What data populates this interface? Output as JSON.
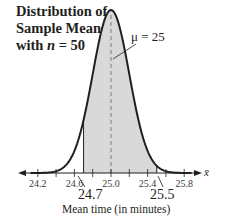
{
  "title": {
    "line1": "Distribution of",
    "line2": "Sample Means",
    "line3_prefix": "with ",
    "line3_var": "n",
    "line3_suffix": " = 50"
  },
  "annotations": {
    "mu_label": "μ = 25",
    "x_variable": "x̄",
    "lower_bound_label": "24.7",
    "upper_bound_label": "25.5"
  },
  "axis": {
    "xlabel": "Mean time (in minutes)",
    "tick_labels": [
      "24.2",
      "24.6",
      "25.0",
      "25.4",
      "25.8"
    ]
  },
  "colors": {
    "curve": "#231f20",
    "shade": "#d9d9d9",
    "mean_line": "#8a8a8a",
    "axis": "#231f20"
  },
  "chart_data": {
    "type": "area",
    "title": "Distribution of Sample Means with n = 50",
    "xlabel": "Mean time (in minutes)",
    "ylabel": "",
    "distribution": "normal",
    "mean": 25,
    "std_dev": 0.2,
    "n": 50,
    "xlim": [
      24.0,
      26.0
    ],
    "x_ticks": [
      24.2,
      24.4,
      24.6,
      24.8,
      25.0,
      25.2,
      25.4,
      25.6,
      25.8
    ],
    "x_tick_labels": [
      "24.2",
      "24.6",
      "25.0",
      "25.4",
      "25.8"
    ],
    "shaded_region": [
      24.7,
      25.5
    ],
    "annotations": [
      "μ = 25",
      "24.7",
      "25.5",
      "x̄"
    ],
    "grid": false,
    "legend": "none"
  }
}
